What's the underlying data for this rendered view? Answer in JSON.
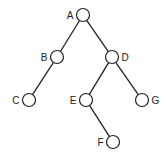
{
  "diagram": {
    "type": "binary-tree",
    "nodes": [
      {
        "id": "A",
        "label": "A",
        "x": 83,
        "y": 15,
        "label_side": "left"
      },
      {
        "id": "B",
        "label": "B",
        "x": 57,
        "y": 57,
        "label_side": "left"
      },
      {
        "id": "C",
        "label": "C",
        "x": 29,
        "y": 100,
        "label_side": "left"
      },
      {
        "id": "D",
        "label": "D",
        "x": 112,
        "y": 57,
        "label_side": "right"
      },
      {
        "id": "E",
        "label": "E",
        "x": 86,
        "y": 100,
        "label_side": "left"
      },
      {
        "id": "F",
        "label": "F",
        "x": 113,
        "y": 142,
        "label_side": "left"
      },
      {
        "id": "G",
        "label": "G",
        "x": 142,
        "y": 100,
        "label_side": "right"
      }
    ],
    "edges": [
      [
        "A",
        "B"
      ],
      [
        "A",
        "D"
      ],
      [
        "B",
        "C"
      ],
      [
        "D",
        "E"
      ],
      [
        "D",
        "G"
      ],
      [
        "E",
        "F"
      ]
    ],
    "colors": {
      "stroke": "#222222",
      "node_fill": "#ffffff"
    }
  }
}
